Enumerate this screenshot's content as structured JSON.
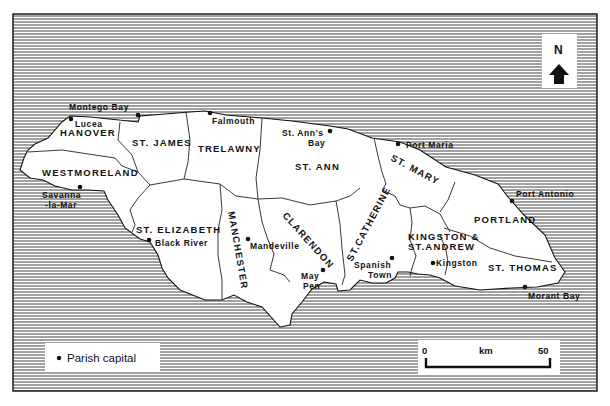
{
  "map": {
    "region": "Jamaica",
    "colors": {
      "land": "#ffffff",
      "sea_hatch": "#3a3a3a",
      "border": "#111111"
    },
    "north_arrow": {
      "label": "N"
    },
    "legend": {
      "symbol": "•",
      "label": "Parish capital"
    },
    "scale_bar": {
      "start": "0",
      "unit": "km",
      "end": "50"
    },
    "parishes": [
      {
        "name": "HANOVER"
      },
      {
        "name": "WESTMORELAND"
      },
      {
        "name": "ST. JAMES"
      },
      {
        "name": "TRELAWNY"
      },
      {
        "name": "ST. ANN"
      },
      {
        "name": "ST. MARY"
      },
      {
        "name": "PORTLAND"
      },
      {
        "name": "ST. ELIZABETH"
      },
      {
        "name": "MANCHESTER"
      },
      {
        "name": "CLARENDON"
      },
      {
        "name": "ST.CATHERINE"
      },
      {
        "name": "KINGSTON &",
        "line2": "ST.ANDREW"
      },
      {
        "name": "ST. THOMAS"
      }
    ],
    "capitals": [
      {
        "name": "Montego Bay"
      },
      {
        "name": "Lucea"
      },
      {
        "name": "Savanna",
        "line2": "-la-Mar"
      },
      {
        "name": "Falmouth"
      },
      {
        "name": "St. Ann's",
        "line2": "Bay"
      },
      {
        "name": "Port Maria"
      },
      {
        "name": "Port Antonio"
      },
      {
        "name": "Black River"
      },
      {
        "name": "Mandeville"
      },
      {
        "name": "May",
        "line2": "Pen"
      },
      {
        "name": "Spanish",
        "line2": "Town"
      },
      {
        "name": "Kingston"
      },
      {
        "name": "Morant Bay"
      }
    ]
  }
}
